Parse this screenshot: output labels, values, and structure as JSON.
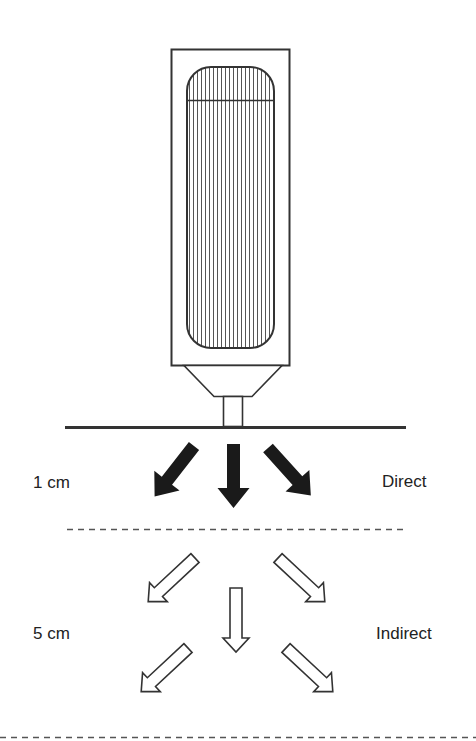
{
  "diagram": {
    "type": "device-distance-illustration",
    "device": {
      "name": "probe-device",
      "description": "Rectangular device with vertically-striped rounded window, funnel nozzle and stem touching surface line"
    },
    "surface_line": {
      "x1": 65,
      "x2": 406,
      "y": 427
    },
    "zones": [
      {
        "distance_label": "1 cm",
        "mode_label": "Direct",
        "arrow_style": "solid",
        "arrow_count": 3
      },
      {
        "distance_label": "5 cm",
        "mode_label": "Indirect",
        "arrow_style": "hollow",
        "arrow_count": 5
      }
    ],
    "separators": [
      {
        "style": "dashed",
        "y": 529,
        "x1": 67,
        "x2": 403
      },
      {
        "style": "dashed",
        "y": 737,
        "x1": 0,
        "x2": 476
      }
    ],
    "colors": {
      "stroke": "#333333",
      "solid_arrow": "#1a1a1a",
      "hatch": "#555555",
      "text": "#222222",
      "dash": "#555555"
    }
  },
  "labels": {
    "zone1_distance": "1 cm",
    "zone1_mode": "Direct",
    "zone2_distance": "5 cm",
    "zone2_mode": "Indirect"
  }
}
